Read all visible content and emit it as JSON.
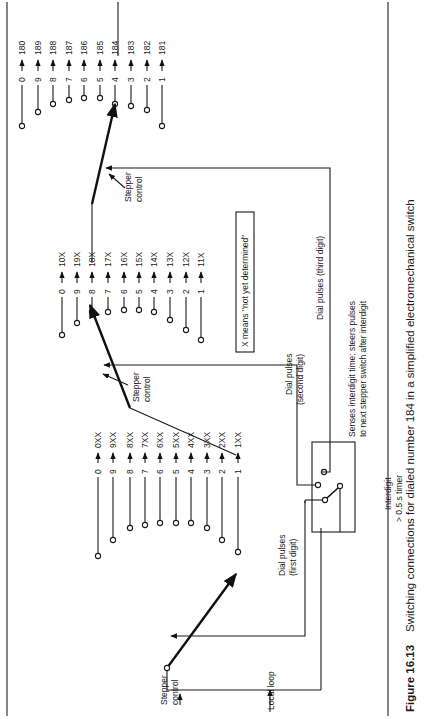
{
  "figure": {
    "number": "Figure 16.13",
    "caption": "Switching connections for dialed number 184 in a simplified electromechanical switch",
    "orientation": "rotated 90° counter-clockwise"
  },
  "labels": {
    "local_loop": "Local loop",
    "stepper_control": [
      "Stepper",
      "control"
    ],
    "dial_pulses_first": [
      "Dial pulses",
      "(first digit)"
    ],
    "dial_pulses_second": [
      "Dial pulses",
      "(second digit)"
    ],
    "dial_pulses_third": "Dial pulses (third digit)",
    "timer_box_note": [
      "Senses interdigit time; steers pulses",
      "to next stepper switch after interdigit"
    ],
    "timer": [
      "Interdigit",
      "> 0.5 s timer"
    ],
    "legend": "X means \"not yet determined\""
  },
  "steppers": [
    {
      "name": "first-digit-stepper",
      "selected": "1",
      "contacts": [
        {
          "digit": "0",
          "out": "0XX"
        },
        {
          "digit": "9",
          "out": "9XX"
        },
        {
          "digit": "8",
          "out": "8XX"
        },
        {
          "digit": "7",
          "out": "7XX"
        },
        {
          "digit": "6",
          "out": "6XX"
        },
        {
          "digit": "5",
          "out": "5XX"
        },
        {
          "digit": "4",
          "out": "4XX"
        },
        {
          "digit": "3",
          "out": "3XX"
        },
        {
          "digit": "2",
          "out": "2XX"
        },
        {
          "digit": "1",
          "out": "1XX"
        }
      ]
    },
    {
      "name": "second-digit-stepper",
      "selected": "8",
      "contacts": [
        {
          "digit": "0",
          "out": "10X"
        },
        {
          "digit": "9",
          "out": "19X"
        },
        {
          "digit": "8",
          "out": "18X"
        },
        {
          "digit": "7",
          "out": "17X"
        },
        {
          "digit": "6",
          "out": "16X"
        },
        {
          "digit": "5",
          "out": "15X"
        },
        {
          "digit": "4",
          "out": "14X"
        },
        {
          "digit": "3",
          "out": "13X"
        },
        {
          "digit": "2",
          "out": "12X"
        },
        {
          "digit": "1",
          "out": "11X"
        }
      ]
    },
    {
      "name": "third-digit-stepper",
      "selected": "4",
      "contacts": [
        {
          "digit": "0",
          "out": "180"
        },
        {
          "digit": "9",
          "out": "189"
        },
        {
          "digit": "8",
          "out": "188"
        },
        {
          "digit": "7",
          "out": "187"
        },
        {
          "digit": "6",
          "out": "186"
        },
        {
          "digit": "5",
          "out": "185"
        },
        {
          "digit": "4",
          "out": "184"
        },
        {
          "digit": "3",
          "out": "183"
        },
        {
          "digit": "2",
          "out": "182"
        },
        {
          "digit": "1",
          "out": "181"
        }
      ]
    }
  ],
  "dialed_number": "184"
}
